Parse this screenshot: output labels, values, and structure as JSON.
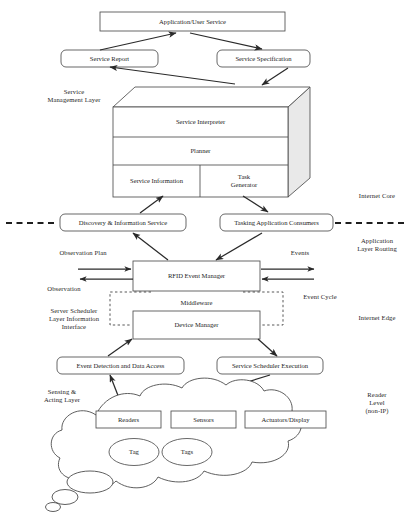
{
  "diagram": {
    "type": "block-architecture-diagram"
  },
  "nodes": {
    "application_user_service": "Application/User Service",
    "service_report": "Service Report",
    "service_specification": "Service Specification",
    "service_interpreter": "Service Interpreter",
    "planner": "Planner",
    "service_information": "Service Information",
    "task_generator": "Task\nGenerator",
    "discovery_information_service": "Discovery & Information Service",
    "tasking_application_consumers": "Tasking Application Consumers",
    "rfid_event_manager": "RFID Event Manager",
    "middleware": "Middleware",
    "device_manager": "Device Manager",
    "event_detection": "Event Detection and Data Access",
    "service_scheduler_execution": "Service Scheduler Execution",
    "readers": "Readers",
    "sensors": "Sensors",
    "actuators_display": "Actuators/Display",
    "tag": "Tag",
    "tags": "Tags"
  },
  "side_labels": {
    "service_management_layer": "Service\nManagement  Layer",
    "internet_core": "Internet Core",
    "application_layer_routing": "Application\nLayer Routing",
    "observation_plan": "Observation Plan",
    "observation": "Observation",
    "events": "Events",
    "event_cycle": "Event Cycle",
    "server_scheduler_layer": "Server Scheduler\nLayer Information\nInterface",
    "internet_edge": "Internet Edge",
    "sensing_acting_layer": "Sensing &\nActing Layer",
    "reader_level": "Reader\nLevel\n(non-IP)"
  },
  "colors": {
    "stroke": "#4d4d4d",
    "text": "#1c1c1c",
    "face_shade": "#e8e8e8",
    "background": "#ffffff"
  }
}
